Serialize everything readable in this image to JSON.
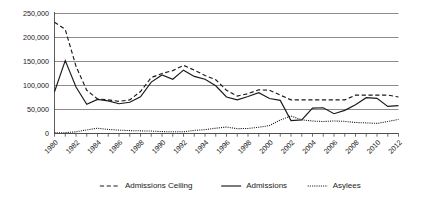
{
  "chart_data": {
    "type": "line",
    "title": "",
    "xlabel": "",
    "ylabel": "",
    "ylim": [
      0,
      250000
    ],
    "ytick_labels": [
      "0",
      "50,000",
      "100,000",
      "150,000",
      "200,000",
      "250,000"
    ],
    "ytick_values": [
      0,
      50000,
      100000,
      150000,
      200000,
      250000
    ],
    "grid": true,
    "legend_position": "bottom",
    "x": [
      1980,
      1981,
      1982,
      1983,
      1984,
      1985,
      1986,
      1987,
      1988,
      1989,
      1990,
      1991,
      1992,
      1993,
      1994,
      1995,
      1996,
      1997,
      1998,
      1999,
      2000,
      2001,
      2002,
      2003,
      2004,
      2005,
      2006,
      2007,
      2008,
      2009,
      2010,
      2011,
      2012
    ],
    "xtick_labels": [
      "1980",
      "1982",
      "1984",
      "1986",
      "1988",
      "1990",
      "1992",
      "1994",
      "1996",
      "1998",
      "2000",
      "2002",
      "2004",
      "2006",
      "2008",
      "2010",
      "2012"
    ],
    "series": [
      {
        "name": "Admissions Ceiling",
        "style": "dashed",
        "values": [
          231700,
          217000,
          140000,
          90000,
          72000,
          70000,
          67000,
          70000,
          87500,
          116500,
          125000,
          131000,
          142000,
          132000,
          121000,
          112000,
          90000,
          78000,
          83000,
          91000,
          90000,
          80000,
          70000,
          70000,
          70000,
          70000,
          70000,
          70000,
          80000,
          80000,
          80000,
          80000,
          76000
        ]
      },
      {
        "name": "Admissions",
        "style": "solid",
        "values": [
          87000,
          152000,
          97000,
          61000,
          71000,
          68000,
          62000,
          65000,
          76500,
          107000,
          122000,
          113000,
          132000,
          119000,
          113000,
          99500,
          76000,
          70000,
          77000,
          85000,
          73000,
          69000,
          27000,
          28500,
          53000,
          53700,
          41200,
          48200,
          60100,
          74600,
          73300,
          56400,
          58200
        ]
      },
      {
        "name": "Asylees",
        "style": "dotted",
        "values": [
          1500,
          1800,
          3500,
          7500,
          11000,
          8500,
          7000,
          6000,
          5500,
          5000,
          4000,
          3500,
          3500,
          6500,
          8000,
          11000,
          13500,
          10000,
          10500,
          13000,
          16500,
          28000,
          36500,
          28500,
          26000,
          25000,
          26100,
          25300,
          22900,
          22100,
          21100,
          24900,
          29400
        ]
      }
    ],
    "legend": [
      {
        "label": "Admissions Ceiling",
        "style": "dashed"
      },
      {
        "label": "Admissions",
        "style": "solid"
      },
      {
        "label": "Asylees",
        "style": "dotted"
      }
    ]
  }
}
